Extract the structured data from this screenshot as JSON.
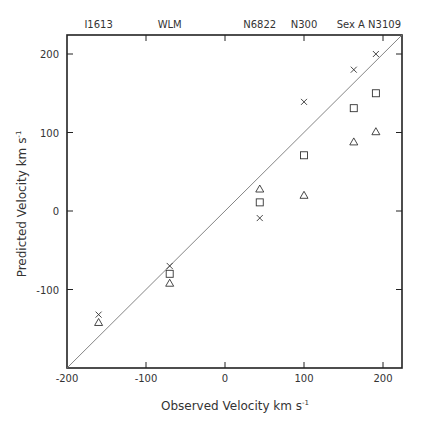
{
  "chart_data": {
    "type": "scatter",
    "title": "",
    "xlabel": "Observed Velocity km s-1",
    "ylabel": "Predicted Velocity km s-1",
    "xlim": [
      -200,
      225
    ],
    "ylim": [
      -200,
      225
    ],
    "x_ticks": [
      -200,
      -100,
      0,
      100,
      200
    ],
    "y_ticks": [
      -100,
      0,
      100,
      200
    ],
    "x_tick_labels": [
      "-200",
      "-100",
      "0",
      "100",
      "200"
    ],
    "y_tick_labels": [
      "-100",
      "0",
      "100",
      "200"
    ],
    "grid": false,
    "reference_line": {
      "type": "identity",
      "from": [
        -200,
        -200
      ],
      "to": [
        225,
        225
      ]
    },
    "top_annotations": [
      {
        "label": "I1613",
        "x": -160
      },
      {
        "label": "WLM",
        "x": -70
      },
      {
        "label": "N6822",
        "x": 44
      },
      {
        "label": "N300",
        "x": 100
      },
      {
        "label": "Sex A N3109",
        "x": 177
      }
    ],
    "galaxies": [
      "IC1613",
      "WLM",
      "N6822",
      "N300",
      "Sex A",
      "N3109"
    ],
    "x": [
      -160,
      -70,
      44,
      100,
      163,
      191
    ],
    "series": [
      {
        "name": "x-marker",
        "marker": "x",
        "values": [
          -132,
          -70,
          -9,
          139,
          180,
          200
        ]
      },
      {
        "name": "square",
        "marker": "square",
        "values": [
          null,
          -80,
          11,
          71,
          131,
          150
        ]
      },
      {
        "name": "triangle",
        "marker": "triangle",
        "values": [
          -142,
          -92,
          28,
          20,
          88,
          101
        ]
      }
    ]
  },
  "caption": "",
  "labels": {
    "xlabel_main": "Observed Velocity km s",
    "xlabel_sup": "-1",
    "ylabel_main": "Predicted Velocity km s",
    "ylabel_sup": "-1"
  }
}
